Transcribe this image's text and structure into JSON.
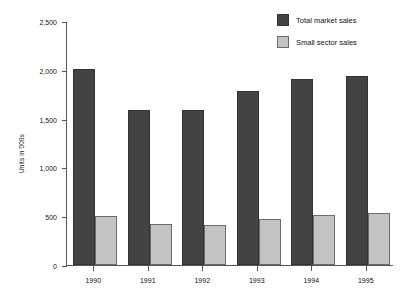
{
  "chart_data": {
    "type": "bar",
    "title": "",
    "subtitle": "",
    "xlabel": "",
    "ylabel": "Units in 000s",
    "categories": [
      "1990",
      "1991",
      "1992",
      "1993",
      "1994",
      "1995"
    ],
    "series": [
      {
        "name": "Total market sales",
        "color": "#434343",
        "values": [
          2010,
          1590,
          1590,
          1780,
          1905,
          1940
        ]
      },
      {
        "name": "Small sector sales",
        "color": "#c3c3c3",
        "values": [
          500,
          425,
          415,
          470,
          515,
          535
        ]
      }
    ],
    "ylim": [
      0,
      2500
    ],
    "y_ticks": [
      0,
      500,
      1000,
      1500,
      2000,
      2500
    ],
    "y_tick_labels": [
      "0",
      "500",
      "1,000",
      "1,500",
      "2,000",
      "2,500"
    ],
    "grid": false,
    "legend_position": "top-right"
  },
  "legend": {
    "items": [
      {
        "label": "Total market sales",
        "swatch": "total"
      },
      {
        "label": "Small sector sales",
        "swatch": "small"
      }
    ]
  },
  "colors": {
    "total_market_sales": "#434343",
    "small_sector_sales": "#c3c3c3",
    "axis": "#555555",
    "background": "#ffffff"
  }
}
